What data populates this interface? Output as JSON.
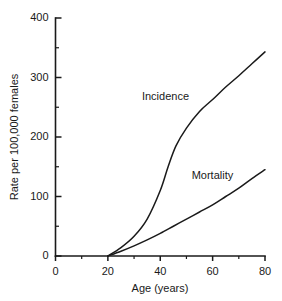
{
  "chart_data": {
    "type": "line",
    "title": "",
    "subtitle": "",
    "xlabel": "Age (years)",
    "ylabel": "Rate per 100,000 females",
    "xlim": [
      0,
      80
    ],
    "ylim": [
      0,
      400
    ],
    "xticks": [
      0,
      20,
      40,
      60,
      80
    ],
    "yticks": [
      0,
      100,
      200,
      300,
      400
    ],
    "xticklabels": [
      "0",
      "20",
      "40",
      "60",
      "80"
    ],
    "yticklabels": [
      "0",
      "100",
      "200",
      "300",
      "400"
    ],
    "x_minor_ticks": [
      10,
      30,
      50,
      70
    ],
    "y_minor_ticks": [
      50,
      150,
      250,
      350
    ],
    "grid": false,
    "legend": "inline-labels",
    "spines": [
      "left",
      "bottom"
    ],
    "series": [
      {
        "name": "Incidence",
        "label_x": 33,
        "label_y": 262,
        "x": [
          20,
          25,
          30,
          35,
          40,
          43,
          46,
          50,
          55,
          60,
          65,
          70,
          75,
          80
        ],
        "values": [
          0,
          14,
          33,
          62,
          110,
          150,
          185,
          215,
          243,
          263,
          284,
          303,
          323,
          343
        ]
      },
      {
        "name": "Mortality",
        "label_x": 52,
        "label_y": 130,
        "x": [
          20,
          25,
          30,
          35,
          40,
          45,
          50,
          55,
          60,
          65,
          70,
          75,
          80
        ],
        "values": [
          0,
          8,
          17,
          27,
          38,
          50,
          62,
          74,
          86,
          100,
          114,
          130,
          145
        ]
      }
    ],
    "annotations": [
      {
        "text": "Incidence",
        "x": 33,
        "y": 262
      },
      {
        "text": "Mortality",
        "x": 52,
        "y": 130
      }
    ]
  }
}
